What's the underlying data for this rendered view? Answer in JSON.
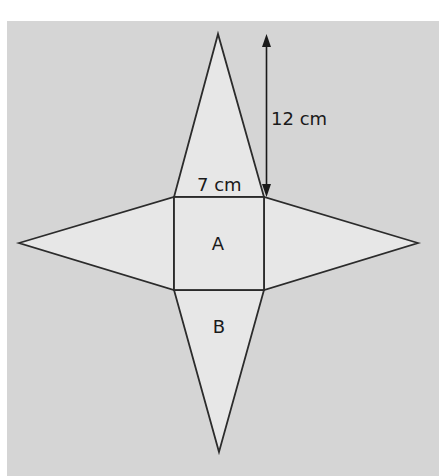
{
  "diagram": {
    "type": "pyramid-net",
    "colors": {
      "background": "#d5d5d5",
      "face_fill": "#e7e7e7",
      "stroke": "#2b2b2b",
      "text": "#1a1a1a"
    },
    "faces": {
      "square_label": "A",
      "triangle_label": "B"
    },
    "dimensions": {
      "base_length": "7 cm",
      "triangle_height": "12 cm"
    }
  }
}
